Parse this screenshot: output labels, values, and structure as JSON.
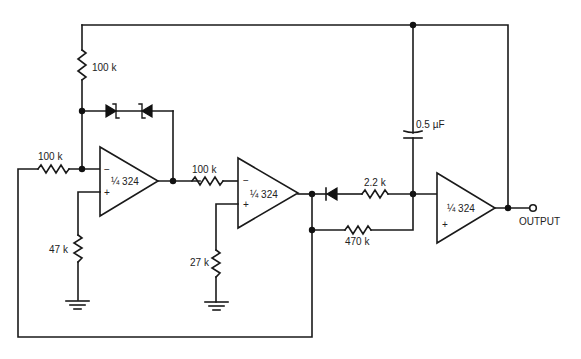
{
  "diagram": {
    "type": "circuit-schematic",
    "opamps": [
      {
        "id": "U1",
        "label": "¼ 324",
        "minus": "−",
        "plus": "+"
      },
      {
        "id": "U2",
        "label": "¼ 324",
        "minus": "−",
        "plus": "+"
      },
      {
        "id": "U3",
        "label": "¼ 324",
        "minus": "−",
        "plus": "+"
      }
    ],
    "resistors": [
      {
        "id": "R_top",
        "value": "100 k"
      },
      {
        "id": "R_in",
        "value": "100 k"
      },
      {
        "id": "R_47",
        "value": "47 k"
      },
      {
        "id": "R_mid",
        "value": "100 k"
      },
      {
        "id": "R_27",
        "value": "27 k"
      },
      {
        "id": "R_22",
        "value": "2.2 k"
      },
      {
        "id": "R_470",
        "value": "470 k"
      }
    ],
    "capacitors": [
      {
        "id": "C1",
        "value": "0.5 µF"
      }
    ],
    "diodes": [
      {
        "id": "Z1",
        "kind": "zener"
      },
      {
        "id": "Z2",
        "kind": "zener"
      },
      {
        "id": "D1",
        "kind": "diode"
      }
    ],
    "output": {
      "label": "OUTPUT"
    }
  }
}
